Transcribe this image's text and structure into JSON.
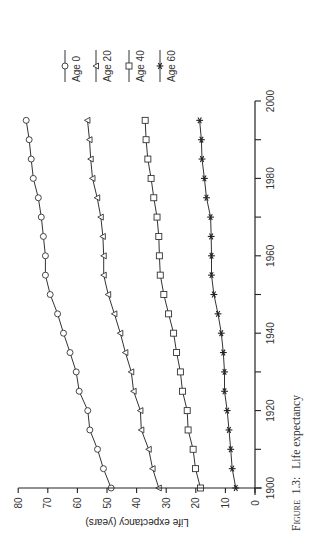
{
  "figure": {
    "caption_prefix": "Figure",
    "caption_number": "1.3:",
    "caption_text": "Life expectancy",
    "orientation": "rotated-90-ccw"
  },
  "chart_data": {
    "type": "line",
    "title": "",
    "caption": "Figure 1.3: Life expectancy",
    "xlabel": "",
    "ylabel": "Life expectancy (years)",
    "xlim": [
      1900,
      2000
    ],
    "ylim": [
      0,
      80
    ],
    "x_ticks": [
      1900,
      1920,
      1940,
      1960,
      1980,
      2000
    ],
    "x_minor_ticks": [
      1910,
      1930,
      1950,
      1970,
      1990
    ],
    "y_ticks": [
      0,
      10,
      20,
      30,
      40,
      50,
      60,
      70,
      80
    ],
    "grid": false,
    "legend_position": "top-right (rotated)",
    "x": [
      1900,
      1905,
      1910,
      1915,
      1920,
      1925,
      1930,
      1935,
      1940,
      1945,
      1950,
      1955,
      1960,
      1965,
      1970,
      1975,
      1980,
      1985,
      1990,
      1995
    ],
    "series": [
      {
        "name": "Age 0",
        "marker": "circle",
        "values": [
          48.6,
          51.2,
          53.2,
          55.8,
          56.5,
          59.4,
          60.4,
          62.5,
          64.7,
          66.7,
          69.2,
          70.8,
          70.8,
          71.5,
          72.2,
          73.2,
          74.9,
          75.6,
          76.3,
          77.3
        ]
      },
      {
        "name": "Age 20",
        "marker": "triangle",
        "values": [
          32.5,
          34.6,
          35.9,
          38.4,
          38.7,
          41.0,
          41.8,
          43.8,
          45.5,
          47.5,
          49.6,
          51.1,
          51.1,
          51.4,
          52.1,
          53.3,
          54.9,
          55.5,
          55.9,
          56.6
        ]
      },
      {
        "name": "Age 40",
        "marker": "square",
        "values": [
          18.4,
          20.1,
          20.9,
          22.6,
          22.9,
          24.5,
          25.2,
          26.5,
          27.5,
          29.2,
          30.8,
          32.0,
          32.3,
          32.5,
          33.1,
          34.2,
          35.1,
          36.2,
          36.8,
          37.1
        ]
      },
      {
        "name": "Age 60",
        "marker": "star",
        "values": [
          6.5,
          7.7,
          8.2,
          8.8,
          9.4,
          10.3,
          10.3,
          10.7,
          11.4,
          12.5,
          13.9,
          14.7,
          14.7,
          14.8,
          15.0,
          16.4,
          17.1,
          17.9,
          18.1,
          18.7
        ]
      }
    ]
  }
}
